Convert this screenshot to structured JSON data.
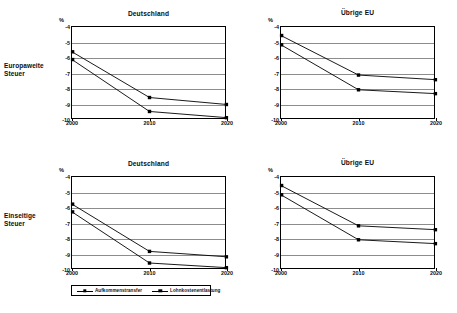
{
  "row_labels": [
    {
      "line1": "Europaweite",
      "line2": "Steuer"
    },
    {
      "line1": "Einseitige",
      "line2": "Steuer"
    }
  ],
  "axis": {
    "unit_label": "%",
    "y_ticks": [
      "-4",
      "-5",
      "-6",
      "-7",
      "-8",
      "-9",
      "-10"
    ],
    "x_ticks": [
      "2000",
      "2010",
      "2020"
    ]
  },
  "legend": {
    "items": [
      {
        "label": "Aufkommenstransfer",
        "marker": "black-square",
        "color": "#000000"
      },
      {
        "label": "Lohnkostenentlastung",
        "marker": "black-square",
        "color": "#000000"
      }
    ]
  },
  "chart_data": [
    {
      "type": "line",
      "panel": "top-left",
      "title": "Deutschland",
      "row": "Europaweite Steuer",
      "x": [
        2000,
        2010,
        2020
      ],
      "categories": [
        "2000",
        "2010",
        "2020"
      ],
      "xlabel": "",
      "ylabel": "%",
      "ylim": [
        -10,
        -4
      ],
      "grid": true,
      "legend_position": "bottom",
      "series": [
        {
          "name": "Aufkommenstransfer",
          "values": [
            -5.6,
            -8.55,
            -9.0
          ]
        },
        {
          "name": "Lohnkostenentlastung",
          "values": [
            -6.1,
            -9.45,
            -9.85
          ]
        }
      ]
    },
    {
      "type": "line",
      "panel": "top-right",
      "title": "Übrige EU",
      "row": "Europaweite Steuer",
      "x": [
        2000,
        2010,
        2020
      ],
      "categories": [
        "2000",
        "2010",
        "2020"
      ],
      "xlabel": "",
      "ylabel": "%",
      "ylim": [
        -10,
        -4
      ],
      "grid": true,
      "legend_position": "bottom",
      "series": [
        {
          "name": "Aufkommenstransfer",
          "values": [
            -4.55,
            -7.1,
            -7.4
          ]
        },
        {
          "name": "Lohnkostenentlastung",
          "values": [
            -5.15,
            -8.05,
            -8.3
          ]
        }
      ]
    },
    {
      "type": "line",
      "panel": "bottom-left",
      "title": "Deutschland",
      "row": "Einseitige Steuer",
      "x": [
        2000,
        2010,
        2020
      ],
      "categories": [
        "2000",
        "2010",
        "2020"
      ],
      "xlabel": "",
      "ylabel": "%",
      "ylim": [
        -10,
        -4
      ],
      "grid": true,
      "legend_position": "bottom",
      "series": [
        {
          "name": "Aufkommenstransfer",
          "values": [
            -5.75,
            -8.8,
            -9.15
          ]
        },
        {
          "name": "Lohnkostenentlastung",
          "values": [
            -6.25,
            -9.55,
            -9.85
          ]
        }
      ]
    },
    {
      "type": "line",
      "panel": "bottom-right",
      "title": "Übrige EU",
      "row": "Einseitige Steuer",
      "x": [
        2000,
        2010,
        2020
      ],
      "categories": [
        "2000",
        "2010",
        "2020"
      ],
      "xlabel": "",
      "ylabel": "%",
      "ylim": [
        -10,
        -4
      ],
      "grid": true,
      "legend_position": "bottom",
      "series": [
        {
          "name": "Aufkommenstransfer",
          "values": [
            -4.55,
            -7.15,
            -7.4
          ]
        },
        {
          "name": "Lohnkostenentlastung",
          "values": [
            -5.15,
            -8.05,
            -8.3
          ]
        }
      ]
    }
  ]
}
